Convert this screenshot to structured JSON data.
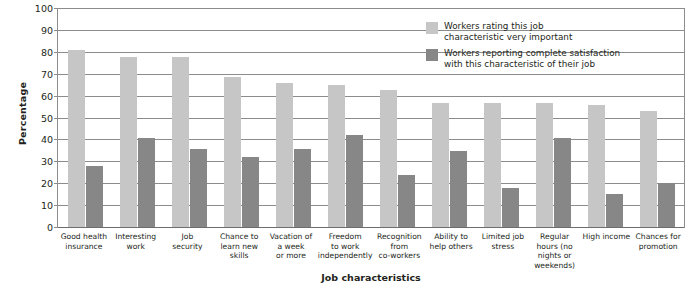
{
  "chart_data": {
    "type": "bar",
    "title": "",
    "xlabel": "Job characteristics",
    "ylabel": "Percentage",
    "ylim": [
      0,
      100
    ],
    "yticks": [
      0,
      10,
      20,
      30,
      40,
      50,
      60,
      70,
      80,
      90,
      100
    ],
    "grid": true,
    "legend_position": "top-right",
    "categories": [
      "Good health insurance",
      "Interesting work",
      "Job security",
      "Chance to learn new skills",
      "Vacation of a week or more",
      "Freedom to work independently",
      "Recognition from co-workers",
      "Ability to help others",
      "Limited job stress",
      "Regular hours (no nights or weekends)",
      "High income",
      "Chances for promotion"
    ],
    "category_lines": [
      [
        "Good health",
        "insurance"
      ],
      [
        "Interesting",
        "work"
      ],
      [
        "Job",
        "security"
      ],
      [
        "Chance to",
        "learn new",
        "skills"
      ],
      [
        "Vacation of",
        "a week",
        "or more"
      ],
      [
        "Freedom",
        "to work",
        "independently"
      ],
      [
        "Recognition",
        "from",
        "co-workers"
      ],
      [
        "Ability to",
        "help others"
      ],
      [
        "Limited job",
        "stress"
      ],
      [
        "Regular",
        "hours (no",
        "nights or",
        "weekends)"
      ],
      [
        "High income"
      ],
      [
        "Chances for",
        "promotion"
      ]
    ],
    "series": [
      {
        "name": "Workers rating this job characteristic very important",
        "name_lines": [
          "Workers rating this job",
          "characteristic very important"
        ],
        "color": "#c6c6c6",
        "values": [
          81,
          78,
          78,
          69,
          66,
          65,
          63,
          57,
          57,
          57,
          56,
          53
        ]
      },
      {
        "name": "Workers reporting complete satisfaction with this characteristic of their job",
        "name_lines": [
          "Workers reporting complete satisfaction",
          "with this characteristic of their job"
        ],
        "color": "#878787",
        "values": [
          28,
          41,
          36,
          32,
          36,
          42,
          24,
          35,
          18,
          41,
          15,
          20
        ]
      }
    ]
  }
}
